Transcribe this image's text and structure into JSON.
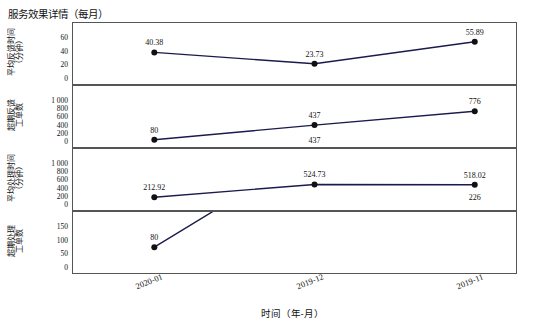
{
  "chart_data": {
    "type": "line",
    "title": "服务效果详情（每月）",
    "xlabel": "时间（年-月）",
    "categories": [
      "2020-01",
      "2019-12",
      "2019-11"
    ],
    "grid": false,
    "legend": "none",
    "panels": [
      {
        "ylabel": "平均反馈时间\n（分钟）",
        "ylabel_lines": [
          "平均反馈时间",
          "（分钟）"
        ],
        "ylim": [
          0,
          60
        ],
        "yticks": [
          "0",
          "20",
          "40",
          "60"
        ],
        "values": [
          40.38,
          23.73,
          55.89
        ],
        "labels": [
          "40.38",
          "23.73",
          "55.89"
        ]
      },
      {
        "ylabel": "超期反馈\n工单数",
        "ylabel_lines": [
          "超期反馈",
          "工单数"
        ],
        "ylim": [
          0,
          1000
        ],
        "yticks": [
          "0",
          "200",
          "400",
          "600",
          "800",
          "1 000"
        ],
        "values": [
          80,
          437,
          776
        ],
        "labels": [
          "80",
          "437",
          "776"
        ]
      },
      {
        "ylabel": "平均处理时间\n（分钟）",
        "ylabel_lines": [
          "平均处理时间",
          "（分钟）"
        ],
        "ylim": [
          0,
          1000
        ],
        "yticks": [
          "0",
          "200",
          "400",
          "600",
          "800",
          "1 000"
        ],
        "values": [
          212.92,
          524.73,
          518.02
        ],
        "labels": [
          "212.92",
          "524.73",
          "518.02"
        ]
      },
      {
        "ylabel": "超期处理\n工单数",
        "ylabel_lines": [
          "超期处理",
          "工单数"
        ],
        "ylim": [
          0,
          150
        ],
        "yticks": [
          "0",
          "50",
          "100",
          "150"
        ],
        "values": [
          80,
          437,
          226
        ],
        "labels": [
          "80",
          "437",
          "226"
        ]
      }
    ],
    "colors": {
      "line": "#1a1a4d",
      "marker": "#111111",
      "axis": "#555555",
      "text": "#111111",
      "background": "#ffffff"
    }
  }
}
